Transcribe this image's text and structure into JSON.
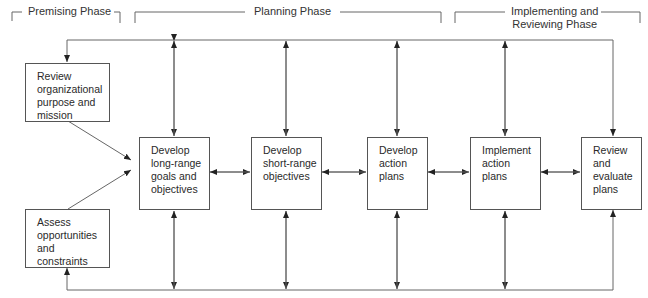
{
  "phases": [
    {
      "id": "premising",
      "label": "Premising Phase"
    },
    {
      "id": "planning",
      "label": "Planning Phase"
    },
    {
      "id": "implementing",
      "label": "Implementing and\nReviewing Phase"
    }
  ],
  "nodes": {
    "review_purpose": {
      "text": "Review\norganizational\npurpose and\nmission"
    },
    "assess": {
      "text": "Assess\nopportunities\nand\nconstraints"
    },
    "long_range": {
      "text": "Develop\nlong-range\ngoals and\nobjectives"
    },
    "short_range": {
      "text": "Develop\nshort-range\nobjectives"
    },
    "action_plans": {
      "text": "Develop\naction\nplans"
    },
    "implement": {
      "text": "Implement\naction\nplans"
    },
    "evaluate": {
      "text": "Review\nand\nevaluate\nplans"
    }
  },
  "edges": [
    {
      "from": "review_purpose",
      "to": "long_range",
      "type": "directed"
    },
    {
      "from": "assess",
      "to": "long_range",
      "type": "directed"
    },
    {
      "from": "long_range",
      "to": "short_range",
      "type": "bidirectional"
    },
    {
      "from": "short_range",
      "to": "action_plans",
      "type": "bidirectional"
    },
    {
      "from": "action_plans",
      "to": "implement",
      "type": "bidirectional"
    },
    {
      "from": "implement",
      "to": "evaluate",
      "type": "bidirectional"
    },
    {
      "from": "top_feedback_loop",
      "to": "review_purpose",
      "type": "directed"
    },
    {
      "from": "evaluate",
      "to": "top_feedback_loop",
      "type": "directed-reverse",
      "note": "top loop feeds down into evaluate"
    },
    {
      "from": "bottom_feedback_loop",
      "to": "assess",
      "type": "directed"
    },
    {
      "from": "bottom_feedback_loop",
      "to": "evaluate",
      "type": "directed"
    },
    {
      "from": "long_range",
      "to": "top_feedback_loop",
      "type": "bidirectional"
    },
    {
      "from": "short_range",
      "to": "top_feedback_loop",
      "type": "bidirectional"
    },
    {
      "from": "action_plans",
      "to": "top_feedback_loop",
      "type": "bidirectional"
    },
    {
      "from": "implement",
      "to": "top_feedback_loop",
      "type": "bidirectional"
    },
    {
      "from": "long_range",
      "to": "bottom_feedback_loop",
      "type": "bidirectional"
    },
    {
      "from": "short_range",
      "to": "bottom_feedback_loop",
      "type": "bidirectional"
    },
    {
      "from": "action_plans",
      "to": "bottom_feedback_loop",
      "type": "bidirectional"
    },
    {
      "from": "implement",
      "to": "bottom_feedback_loop",
      "type": "bidirectional"
    }
  ]
}
